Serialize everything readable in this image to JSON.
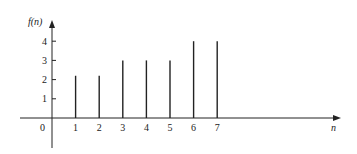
{
  "chart_data": {
    "type": "stem",
    "title": "",
    "xlabel": "n",
    "ylabel": "f(n)",
    "x": [
      1,
      2,
      3,
      4,
      5,
      6,
      7
    ],
    "values": [
      2.2,
      2.2,
      3,
      3,
      3,
      4,
      4
    ],
    "x_ticks": [
      "0",
      "1",
      "2",
      "3",
      "4",
      "5",
      "6",
      "7"
    ],
    "y_ticks": [
      "1",
      "2",
      "3",
      "4"
    ],
    "ylim": [
      0,
      4.5
    ],
    "grid": false,
    "legend": null
  },
  "labels": {
    "ylabel": "f(n)",
    "xlabel": "n",
    "origin": "0"
  },
  "colors": {
    "stem": "#222222",
    "axis": "#222222"
  }
}
